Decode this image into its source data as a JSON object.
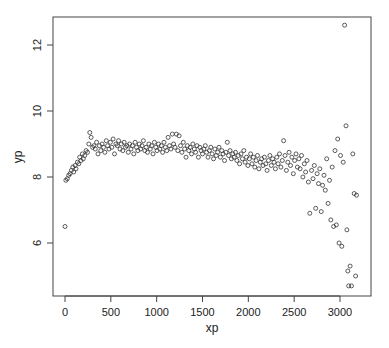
{
  "chart_data": {
    "type": "scatter",
    "title": "",
    "xlabel": "xp",
    "ylabel": "yp",
    "xlim": [
      -120,
      3250
    ],
    "ylim": [
      4.55,
      12.95
    ],
    "xticks": [
      0,
      500,
      1000,
      1500,
      2000,
      2500,
      3000
    ],
    "xtick_labels": [
      "0",
      "500",
      "1000",
      "1500",
      "2000",
      "2500",
      "3000"
    ],
    "yticks": [
      6,
      8,
      10,
      12
    ],
    "ytick_labels": [
      "6",
      "8",
      "10",
      "12"
    ],
    "grid": false,
    "legend": null,
    "marker": "open-circle",
    "marker_color": "#333333",
    "points": [
      [
        0,
        6.5
      ],
      [
        10,
        7.9
      ],
      [
        25,
        7.95
      ],
      [
        40,
        8.05
      ],
      [
        55,
        8.1
      ],
      [
        70,
        8.2
      ],
      [
        85,
        8.3
      ],
      [
        95,
        8.15
      ],
      [
        110,
        8.35
      ],
      [
        120,
        8.25
      ],
      [
        135,
        8.45
      ],
      [
        150,
        8.4
      ],
      [
        160,
        8.6
      ],
      [
        175,
        8.5
      ],
      [
        190,
        8.7
      ],
      [
        200,
        8.55
      ],
      [
        215,
        8.65
      ],
      [
        230,
        8.8
      ],
      [
        245,
        8.75
      ],
      [
        260,
        9.0
      ],
      [
        270,
        9.35
      ],
      [
        285,
        9.2
      ],
      [
        300,
        8.9
      ],
      [
        315,
        8.95
      ],
      [
        330,
        8.85
      ],
      [
        345,
        9.05
      ],
      [
        360,
        8.7
      ],
      [
        375,
        8.95
      ],
      [
        390,
        8.8
      ],
      [
        405,
        9.0
      ],
      [
        420,
        8.9
      ],
      [
        435,
        8.75
      ],
      [
        450,
        9.1
      ],
      [
        465,
        8.95
      ],
      [
        480,
        8.85
      ],
      [
        495,
        9.05
      ],
      [
        510,
        8.9
      ],
      [
        525,
        9.15
      ],
      [
        540,
        8.7
      ],
      [
        555,
        9.0
      ],
      [
        570,
        8.95
      ],
      [
        585,
        9.1
      ],
      [
        600,
        8.85
      ],
      [
        615,
        9.0
      ],
      [
        630,
        8.8
      ],
      [
        645,
        9.05
      ],
      [
        660,
        8.9
      ],
      [
        675,
        8.95
      ],
      [
        690,
        8.75
      ],
      [
        705,
        9.0
      ],
      [
        720,
        8.85
      ],
      [
        735,
        8.95
      ],
      [
        750,
        8.7
      ],
      [
        765,
        9.05
      ],
      [
        780,
        8.9
      ],
      [
        795,
        8.8
      ],
      [
        810,
        9.0
      ],
      [
        825,
        8.85
      ],
      [
        840,
        8.95
      ],
      [
        855,
        9.1
      ],
      [
        870,
        8.8
      ],
      [
        885,
        8.9
      ],
      [
        900,
        8.75
      ],
      [
        915,
        9.0
      ],
      [
        930,
        8.85
      ],
      [
        945,
        8.95
      ],
      [
        960,
        8.7
      ],
      [
        975,
        9.05
      ],
      [
        990,
        8.9
      ],
      [
        1005,
        8.8
      ],
      [
        1020,
        9.0
      ],
      [
        1035,
        8.85
      ],
      [
        1050,
        8.95
      ],
      [
        1065,
        8.75
      ],
      [
        1080,
        9.05
      ],
      [
        1095,
        8.9
      ],
      [
        1110,
        8.8
      ],
      [
        1125,
        9.2
      ],
      [
        1140,
        8.95
      ],
      [
        1155,
        8.85
      ],
      [
        1170,
        9.3
      ],
      [
        1185,
        9.0
      ],
      [
        1200,
        8.9
      ],
      [
        1215,
        9.3
      ],
      [
        1230,
        8.8
      ],
      [
        1245,
        9.25
      ],
      [
        1260,
        8.95
      ],
      [
        1275,
        8.75
      ],
      [
        1290,
        9.05
      ],
      [
        1305,
        8.85
      ],
      [
        1320,
        8.6
      ],
      [
        1335,
        8.95
      ],
      [
        1350,
        8.8
      ],
      [
        1365,
        8.9
      ],
      [
        1380,
        8.7
      ],
      [
        1395,
        9.0
      ],
      [
        1410,
        8.85
      ],
      [
        1425,
        8.75
      ],
      [
        1440,
        8.95
      ],
      [
        1455,
        8.6
      ],
      [
        1470,
        8.9
      ],
      [
        1485,
        8.8
      ],
      [
        1500,
        8.7
      ],
      [
        1515,
        8.85
      ],
      [
        1530,
        8.95
      ],
      [
        1545,
        8.75
      ],
      [
        1560,
        8.6
      ],
      [
        1575,
        8.8
      ],
      [
        1590,
        8.9
      ],
      [
        1605,
        8.7
      ],
      [
        1620,
        8.55
      ],
      [
        1635,
        8.85
      ],
      [
        1650,
        8.65
      ],
      [
        1665,
        8.75
      ],
      [
        1680,
        8.9
      ],
      [
        1695,
        8.6
      ],
      [
        1710,
        8.8
      ],
      [
        1725,
        8.7
      ],
      [
        1740,
        8.5
      ],
      [
        1755,
        8.75
      ],
      [
        1770,
        9.05
      ],
      [
        1785,
        8.65
      ],
      [
        1800,
        8.8
      ],
      [
        1815,
        8.55
      ],
      [
        1830,
        8.7
      ],
      [
        1845,
        8.6
      ],
      [
        1860,
        8.75
      ],
      [
        1875,
        8.5
      ],
      [
        1890,
        8.65
      ],
      [
        1905,
        8.4
      ],
      [
        1920,
        8.7
      ],
      [
        1935,
        8.55
      ],
      [
        1950,
        8.8
      ],
      [
        1965,
        8.45
      ],
      [
        1980,
        8.6
      ],
      [
        1995,
        8.35
      ],
      [
        2010,
        8.55
      ],
      [
        2025,
        8.7
      ],
      [
        2040,
        8.4
      ],
      [
        2055,
        8.6
      ],
      [
        2070,
        8.3
      ],
      [
        2085,
        8.5
      ],
      [
        2100,
        8.65
      ],
      [
        2115,
        8.25
      ],
      [
        2130,
        8.45
      ],
      [
        2145,
        8.55
      ],
      [
        2160,
        8.35
      ],
      [
        2175,
        8.6
      ],
      [
        2190,
        8.4
      ],
      [
        2205,
        8.2
      ],
      [
        2220,
        8.5
      ],
      [
        2235,
        8.65
      ],
      [
        2250,
        8.35
      ],
      [
        2265,
        8.55
      ],
      [
        2280,
        8.45
      ],
      [
        2295,
        8.25
      ],
      [
        2310,
        8.6
      ],
      [
        2325,
        8.4
      ],
      [
        2340,
        8.7
      ],
      [
        2355,
        8.3
      ],
      [
        2370,
        8.5
      ],
      [
        2385,
        9.1
      ],
      [
        2400,
        8.65
      ],
      [
        2415,
        8.2
      ],
      [
        2430,
        8.45
      ],
      [
        2445,
        8.75
      ],
      [
        2460,
        8.35
      ],
      [
        2475,
        8.6
      ],
      [
        2490,
        8.1
      ],
      [
        2505,
        8.5
      ],
      [
        2520,
        8.7
      ],
      [
        2535,
        8.3
      ],
      [
        2550,
        8.55
      ],
      [
        2565,
        8.25
      ],
      [
        2580,
        8.65
      ],
      [
        2595,
        8.0
      ],
      [
        2610,
        8.4
      ],
      [
        2625,
        8.15
      ],
      [
        2640,
        8.5
      ],
      [
        2655,
        7.85
      ],
      [
        2670,
        6.9
      ],
      [
        2690,
        8.2
      ],
      [
        2705,
        7.95
      ],
      [
        2720,
        8.35
      ],
      [
        2735,
        7.05
      ],
      [
        2750,
        8.1
      ],
      [
        2765,
        7.8
      ],
      [
        2780,
        8.25
      ],
      [
        2795,
        6.95
      ],
      [
        2810,
        7.75
      ],
      [
        2825,
        8.05
      ],
      [
        2840,
        7.6
      ],
      [
        2855,
        8.55
      ],
      [
        2870,
        7.2
      ],
      [
        2885,
        7.9
      ],
      [
        2900,
        6.7
      ],
      [
        2915,
        8.3
      ],
      [
        2930,
        6.5
      ],
      [
        2945,
        8.8
      ],
      [
        2960,
        6.55
      ],
      [
        2975,
        9.15
      ],
      [
        2990,
        6.0
      ],
      [
        3005,
        8.65
      ],
      [
        3020,
        5.9
      ],
      [
        3035,
        8.45
      ],
      [
        3050,
        12.6
      ],
      [
        3065,
        9.55
      ],
      [
        3075,
        6.4
      ],
      [
        3085,
        5.15
      ],
      [
        3095,
        4.7
      ],
      [
        3110,
        5.3
      ],
      [
        3125,
        4.7
      ],
      [
        3140,
        8.7
      ],
      [
        3155,
        7.5
      ],
      [
        3170,
        5.0
      ],
      [
        3180,
        7.45
      ]
    ]
  }
}
